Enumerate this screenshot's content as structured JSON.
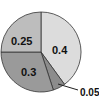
{
  "chart_data": {
    "type": "pie",
    "title": "",
    "slices": [
      {
        "label": "0.4",
        "value": 0.4,
        "color": "#dcdcdc"
      },
      {
        "label": "0.05",
        "value": 0.05,
        "color": "#8c8c8c"
      },
      {
        "label": "0.3",
        "value": 0.3,
        "color": "#9a9a9a"
      },
      {
        "label": "0.25",
        "value": 0.25,
        "color": "#bdbdbd"
      }
    ],
    "start_angle": "top",
    "direction": "clockwise",
    "legend": "none"
  }
}
